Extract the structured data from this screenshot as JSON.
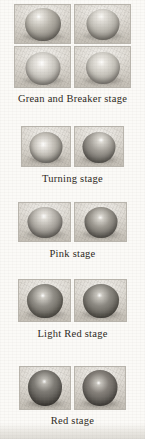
{
  "figure": {
    "background_color": "#fbfaf7",
    "caption_color": "#2b2721",
    "panel_border_color": "#b9b5ad",
    "stages": [
      {
        "id": "green-and-breaker",
        "caption": "Grean and Breaker stage",
        "rows": 2,
        "columns": 2,
        "panels": [
          {
            "name": "green-breaker-panel-1",
            "fruit_color": "#9a968e",
            "highlight": "strong-upper-left"
          },
          {
            "name": "green-breaker-panel-2",
            "fruit_color": "#a9a69f",
            "highlight": "diffuse-top"
          },
          {
            "name": "green-breaker-panel-3",
            "fruit_color": "#b0ada6",
            "highlight": "center-bright"
          },
          {
            "name": "green-breaker-panel-4",
            "fruit_color": "#aba8a1",
            "highlight": "center-bright"
          }
        ]
      },
      {
        "id": "turning",
        "caption": "Turning stage",
        "rows": 1,
        "columns": 2,
        "panels": [
          {
            "name": "turning-panel-1",
            "fruit_color": "#9b9views"
          },
          {
            "name": "turning-panel-2",
            "fruit_color": "#7d7a74"
          }
        ]
      },
      {
        "id": "pink",
        "caption": "Pink stage",
        "rows": 1,
        "columns": 2,
        "panels": [
          {
            "name": "pink-panel-1",
            "fruit_color": "#8d8a84"
          },
          {
            "name": "pink-panel-2",
            "fruit_color": "#6f6c67"
          }
        ]
      },
      {
        "id": "light-red",
        "caption": "Light Red stage",
        "rows": 1,
        "columns": 2,
        "panels": [
          {
            "name": "light-red-panel-1",
            "fruit_color": "#605d58"
          },
          {
            "name": "light-red-panel-2",
            "fruit_color": "#5b5853"
          }
        ]
      },
      {
        "id": "red",
        "caption": "Red stage",
        "rows": 1,
        "columns": 2,
        "panels": [
          {
            "name": "red-panel-1",
            "fruit_color": "#4c4945"
          },
          {
            "name": "red-panel-2",
            "fruit_color": "#524f4a"
          }
        ]
      }
    ]
  }
}
